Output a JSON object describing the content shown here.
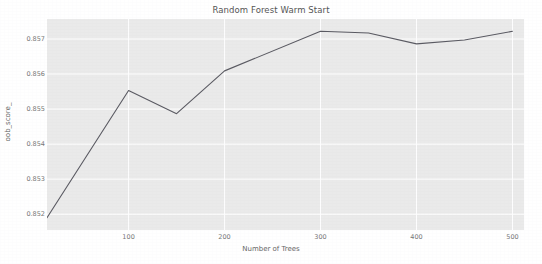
{
  "chart_data": {
    "type": "line",
    "title": "Random Forest Warm Start",
    "xlabel": "Number of Trees",
    "ylabel": "oob_score_",
    "x": [
      15,
      100,
      150,
      200,
      300,
      350,
      400,
      450,
      500
    ],
    "values": [
      0.8519,
      0.85553,
      0.85487,
      0.85609,
      0.85722,
      0.85717,
      0.85686,
      0.85697,
      0.85722
    ],
    "series": [
      {
        "name": "oob_score_",
        "x": [
          15,
          100,
          150,
          200,
          300,
          350,
          400,
          450,
          500
        ],
        "values": [
          0.8519,
          0.85553,
          0.85487,
          0.85609,
          0.85722,
          0.85717,
          0.85686,
          0.85697,
          0.85722
        ]
      }
    ],
    "xlim": [
      15,
      512
    ],
    "ylim": [
      0.85155,
      0.85757
    ],
    "xticks": [
      100,
      200,
      300,
      400,
      500
    ],
    "xtick_labels": [
      "100",
      "200",
      "300",
      "400",
      "500"
    ],
    "yticks": [
      0.852,
      0.853,
      0.854,
      0.855,
      0.856,
      0.857
    ],
    "ytick_labels": [
      "0.852",
      "0.853",
      "0.854",
      "0.855",
      "0.856",
      "0.857"
    ],
    "grid": true,
    "grid_color": "#ffffff",
    "legend": null,
    "legend_position": "none",
    "line_color": "#5a5a62",
    "plot_background": "#eaeaea",
    "figure_background": "#ffffff"
  }
}
